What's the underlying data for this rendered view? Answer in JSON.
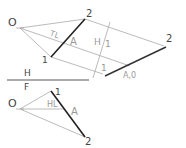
{
  "diagram": {
    "type": "descriptive-geometry-auxiliary-view",
    "colors": {
      "thin_line": "#aaaaaa",
      "thick_line": "#222222",
      "text": "#444444",
      "text_light": "#999999"
    },
    "top_view": {
      "points": {
        "O": "O",
        "p1": "1",
        "p2": "2"
      },
      "labels": {
        "true_length": "TL",
        "A": "A"
      }
    },
    "fold_line_h1": {
      "left_label": "H",
      "right_label": "1"
    },
    "auxiliary_view": {
      "labels": {
        "p2": "2",
        "p1": "1",
        "point_view": "A,0"
      }
    },
    "fold_line_hf": {
      "top_label": "H",
      "bottom_label": "F"
    },
    "front_view": {
      "points": {
        "O": "O",
        "p1": "1",
        "p2": "2"
      },
      "labels": {
        "horizontal_line": "HL",
        "A": "A"
      }
    }
  }
}
